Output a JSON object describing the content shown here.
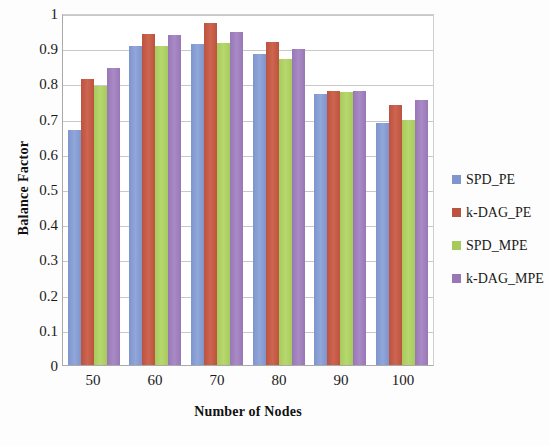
{
  "chart_data": {
    "type": "bar",
    "title": "",
    "xlabel": "Number of Nodes",
    "ylabel": "Balance Factor",
    "categories": [
      "50",
      "60",
      "70",
      "80",
      "90",
      "100"
    ],
    "ylim": [
      0,
      1
    ],
    "ytick_labels": [
      "1",
      "0.9",
      "0.8",
      "0.7",
      "0.6",
      "0.5",
      "0.4",
      "0.3",
      "0.2",
      "0.1",
      "0"
    ],
    "ytick_values": [
      1,
      0.9,
      0.8,
      0.7,
      0.6,
      0.5,
      0.4,
      0.3,
      0.2,
      0.1,
      0
    ],
    "grid": true,
    "legend_position": "right",
    "series": [
      {
        "name": "SPD_PE",
        "color": "#7e95cd",
        "values": [
          0.667,
          0.905,
          0.911,
          0.883,
          0.77,
          0.687
        ]
      },
      {
        "name": "k-DAG_PE",
        "color": "#bc5340",
        "values": [
          0.813,
          0.941,
          0.972,
          0.918,
          0.778,
          0.738
        ]
      },
      {
        "name": "SPD_MPE",
        "color": "#a7cb5b",
        "values": [
          0.793,
          0.905,
          0.915,
          0.868,
          0.775,
          0.697
        ]
      },
      {
        "name": "k-DAG_MPE",
        "color": "#9877b6",
        "values": [
          0.845,
          0.937,
          0.947,
          0.897,
          0.779,
          0.752
        ]
      }
    ]
  },
  "legend": {
    "items": [
      {
        "label": "SPD_PE"
      },
      {
        "label": "k-DAG_PE"
      },
      {
        "label": "SPD_MPE"
      },
      {
        "label": "k-DAG_MPE"
      }
    ]
  }
}
